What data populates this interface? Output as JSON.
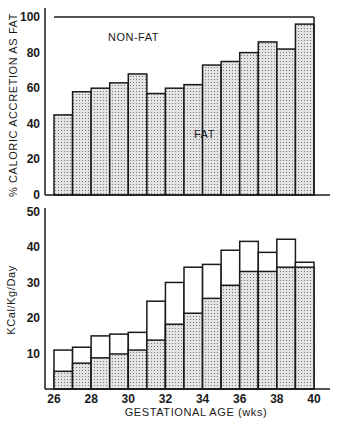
{
  "colors": {
    "ink": "#1a1a1a",
    "fat_fill": "#e4e4e4",
    "fat_dot": "#6a6a6a",
    "nonfat_fill": "#ffffff"
  },
  "chart_data": [
    {
      "type": "bar",
      "subtype": "stacked-percent",
      "title": "",
      "xlabel": "GESTATIONAL AGE (wks)",
      "ylabel": "% CALORIC ACCRETION AS FAT",
      "ylim": [
        0,
        100
      ],
      "yticks": [
        0,
        20,
        40,
        60,
        80,
        100
      ],
      "x_bin_edges": [
        26,
        27,
        28,
        29,
        30,
        31,
        32,
        33,
        34,
        35,
        36,
        37,
        38,
        39,
        40
      ],
      "xticks": [
        26,
        28,
        30,
        32,
        34,
        36,
        38,
        40
      ],
      "grid": false,
      "annotations": [
        "NON-FAT",
        "FAT"
      ],
      "series": [
        {
          "name": "FAT",
          "values": [
            45,
            58,
            60,
            63,
            68,
            57,
            60,
            62,
            73,
            75,
            80,
            86,
            82,
            96
          ]
        },
        {
          "name": "NON-FAT",
          "values": [
            55,
            42,
            40,
            37,
            32,
            43,
            40,
            38,
            27,
            25,
            20,
            14,
            18,
            4
          ]
        }
      ]
    },
    {
      "type": "bar",
      "subtype": "stacked",
      "title": "",
      "xlabel": "GESTATIONAL AGE (wks)",
      "ylabel": "KCal/Kg/Day",
      "ylim": [
        0,
        50
      ],
      "yticks": [
        10,
        20,
        30,
        40,
        50
      ],
      "x_bin_edges": [
        26,
        27,
        28,
        29,
        30,
        31,
        32,
        33,
        34,
        35,
        36,
        37,
        38,
        39,
        40
      ],
      "xticks": [
        26,
        28,
        30,
        32,
        34,
        36,
        38,
        40
      ],
      "grid": false,
      "series": [
        {
          "name": "Fat",
          "values": [
            5,
            7.3,
            8.8,
            9.9,
            11,
            13.8,
            18.3,
            21.4,
            25.6,
            29.3,
            33.2,
            33.2,
            34.4,
            34.4
          ]
        },
        {
          "name": "Total",
          "values": [
            11,
            11.8,
            15,
            15.5,
            16,
            24.8,
            30.1,
            34.4,
            35.2,
            39.2,
            41.7,
            38.6,
            42.3,
            35.8
          ]
        }
      ]
    }
  ],
  "labels": {
    "top_ylabel": "% CALORIC ACCRETION AS FAT",
    "bottom_ylabel": "KCal/Kg/Day",
    "xlabel": "GESTATIONAL AGE (wks)",
    "nonfat": "NON-FAT",
    "fat": "FAT"
  }
}
